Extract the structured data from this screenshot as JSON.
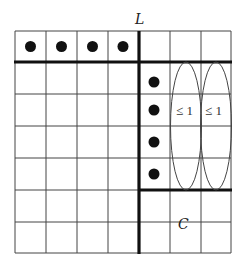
{
  "labels": {
    "top": "L",
    "bottom_right": "C",
    "ellipse_left": "≤ 1",
    "ellipse_right": "≤ 1"
  },
  "grid": {
    "rows": 7,
    "cols": 7
  },
  "dots": [
    {
      "row": 0,
      "col": 0
    },
    {
      "row": 0,
      "col": 1
    },
    {
      "row": 0,
      "col": 2
    },
    {
      "row": 0,
      "col": 3
    },
    {
      "row": 1,
      "col": 4
    },
    {
      "row": 2,
      "col": 4
    },
    {
      "row": 3,
      "col": 4
    },
    {
      "row": 4,
      "col": 4
    }
  ],
  "colors": {
    "line": "#333333",
    "thick": "#111111",
    "dot": "#111111"
  }
}
